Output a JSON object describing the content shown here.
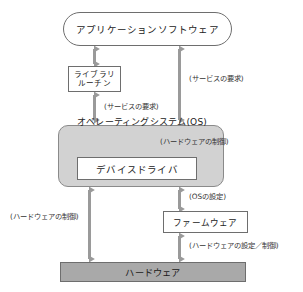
{
  "diagram": {
    "type": "layered-block-diagram",
    "colors": {
      "background": "#ffffff",
      "os_fill": "#d2d2d2",
      "hardware_fill": "#a9a9a9",
      "box_fill": "#ffffff",
      "stroke": "#6e6e6e",
      "arrow": "#9a9a9a",
      "text": "#222222"
    },
    "nodes": {
      "application": {
        "label": "アプリケーションソフトウェア",
        "shape": "stadium"
      },
      "library": {
        "label_line1": "ライブラリ",
        "label_line2": "ルーチン",
        "shape": "rect"
      },
      "os": {
        "label": "オペレーティングシステム(OS)",
        "shape": "rounded-rect"
      },
      "device_driver": {
        "label": "デバイスドライバ",
        "shape": "rect"
      },
      "firmware": {
        "label": "ファームウェア",
        "shape": "rect"
      },
      "hardware": {
        "label": "ハードウェア",
        "shape": "rect"
      }
    },
    "edge_labels": {
      "service_request_left": "(サービスの要求)",
      "service_request_right": "(サービスの要求)",
      "hardware_control_os": "(ハードウェアの制御)",
      "os_setting": "(OSの設定)",
      "hardware_set_control": "(ハードウェアの設定／制御)",
      "hardware_control_left": "(ハードウェアの制御)"
    },
    "edges": [
      {
        "from": "application",
        "to": "library",
        "label": "",
        "arrow": "double"
      },
      {
        "from": "library",
        "to": "os",
        "label": "(サービスの要求)",
        "arrow": "double"
      },
      {
        "from": "application",
        "to": "os",
        "label": "(サービスの要求)",
        "arrow": "double"
      },
      {
        "from": "os",
        "to": "device_driver",
        "label": "(ハードウェアの制御)",
        "arrow": "double"
      },
      {
        "from": "device_driver",
        "to": "firmware",
        "label": "(OSの設定)",
        "arrow": "double"
      },
      {
        "from": "firmware",
        "to": "hardware",
        "label": "(ハードウェアの設定／制御)",
        "arrow": "double"
      },
      {
        "from": "os",
        "to": "hardware",
        "label": "(ハードウェアの制御)",
        "arrow": "double"
      }
    ]
  }
}
